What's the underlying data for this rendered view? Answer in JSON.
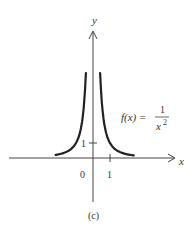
{
  "chart_data": {
    "type": "line",
    "title": "",
    "function_label": {
      "lhs": "f(x) = ",
      "numerator": "1",
      "denominator": "x",
      "exponent": "2"
    },
    "xlabel": "x",
    "ylabel": "y",
    "x_ticks": [
      {
        "value": 1,
        "label": "1"
      }
    ],
    "y_ticks": [
      {
        "value": 1,
        "label": "1"
      }
    ],
    "origin_label": "0",
    "caption": "(c)",
    "series": [
      {
        "name": "f(x) = 1/x^2 (left branch)",
        "x": [
          -2.2,
          -1.5,
          -1.0,
          -0.7,
          -0.55,
          -0.42
        ],
        "y": [
          0.21,
          0.44,
          1.0,
          2.04,
          3.31,
          5.67
        ]
      },
      {
        "name": "f(x) = 1/x^2 (right branch)",
        "x": [
          0.42,
          0.55,
          0.7,
          1.0,
          1.5,
          2.4
        ],
        "y": [
          5.67,
          3.31,
          2.04,
          1.0,
          0.44,
          0.17
        ]
      }
    ],
    "xlim": [
      -5,
      4.8
    ],
    "ylim": [
      -3,
      8.5
    ],
    "grid": false,
    "legend": "none"
  }
}
